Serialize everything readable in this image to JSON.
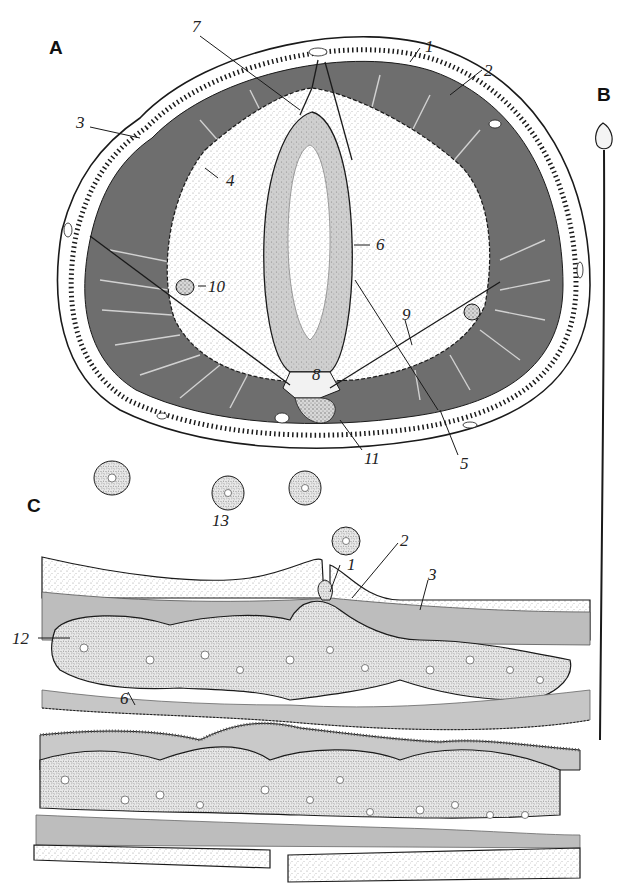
{
  "figure": {
    "panels": [
      {
        "id": "A",
        "label": "A",
        "description": "Transverse cross-section of worm body"
      },
      {
        "id": "B",
        "label": "B",
        "description": "Whole elongated organism, thin filament with bulbous head"
      },
      {
        "id": "C",
        "label": "C",
        "description": "Longitudinal section of body wall with germ cells"
      }
    ],
    "labels_A": [
      {
        "n": "1",
        "x": 425,
        "y": 42
      },
      {
        "n": "2",
        "x": 484,
        "y": 63
      },
      {
        "n": "3",
        "x": 78,
        "y": 118
      },
      {
        "n": "4",
        "x": 225,
        "y": 175
      },
      {
        "n": "5",
        "x": 460,
        "y": 458
      },
      {
        "n": "6",
        "x": 375,
        "y": 238
      },
      {
        "n": "7",
        "x": 192,
        "y": 22
      },
      {
        "n": "8",
        "x": 310,
        "y": 370
      },
      {
        "n": "9",
        "x": 402,
        "y": 310
      },
      {
        "n": "10",
        "x": 210,
        "y": 282
      },
      {
        "n": "11",
        "x": 364,
        "y": 448
      }
    ],
    "labels_C": [
      {
        "n": "13",
        "x": 212,
        "y": 512
      },
      {
        "n": "1",
        "x": 347,
        "y": 560
      },
      {
        "n": "2",
        "x": 400,
        "y": 535
      },
      {
        "n": "3",
        "x": 428,
        "y": 572
      },
      {
        "n": "12",
        "x": 12,
        "y": 633
      },
      {
        "n": "6",
        "x": 120,
        "y": 690
      }
    ],
    "colors": {
      "ink": "#1a1a1a",
      "paper": "#ffffff",
      "stipple": "#9a9a9a",
      "muscle": "#6e6e6e",
      "tissue": "#c9c9c9"
    }
  }
}
